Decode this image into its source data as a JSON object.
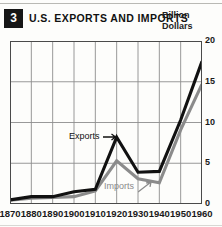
{
  "header": {
    "badge_number": "3",
    "title": "U.S. EXPORTS AND IMPORTS",
    "unit_line1": "Billion",
    "unit_line2": "Dollars"
  },
  "annotations": {
    "exports_label": "Exports",
    "imports_label": "Imports",
    "exports_arrow": "exports-arrow-icon",
    "imports_arrow": "imports-arrow-icon"
  },
  "colors": {
    "exports_line": "#111111",
    "imports_line": "#8b8b8b",
    "grid": "#8d8d8d",
    "axis": "#4a4a4a",
    "background": "#fdfdfb",
    "badge_background": "#161616",
    "badge_text": "#ffffff"
  },
  "chart_data": {
    "type": "line",
    "title": "U.S. EXPORTS AND IMPORTS",
    "xlabel": "",
    "ylabel": "Billion Dollars",
    "xlim": [
      1870,
      1960
    ],
    "ylim": [
      0,
      20
    ],
    "yticks": [
      "0",
      "5",
      "10",
      "15",
      "20"
    ],
    "ytick_values": [
      0,
      5,
      10,
      15,
      20
    ],
    "xticks": [
      "1870",
      "1880",
      "1890",
      "1900",
      "1910",
      "1920",
      "1930",
      "1940",
      "1950",
      "1960"
    ],
    "x": [
      1870,
      1880,
      1890,
      1900,
      1910,
      1920,
      1930,
      1940,
      1950,
      1960
    ],
    "grid": true,
    "legend": "inline-annotations",
    "series": [
      {
        "name": "Exports",
        "color": "#111111",
        "values": [
          0.5,
          0.9,
          0.9,
          1.5,
          1.8,
          8.2,
          3.9,
          4.0,
          10.3,
          17.5
        ]
      },
      {
        "name": "Imports",
        "color": "#8b8b8b",
        "values": [
          0.45,
          0.7,
          0.8,
          0.9,
          1.6,
          5.3,
          3.1,
          2.6,
          9.1,
          14.7
        ]
      }
    ]
  }
}
